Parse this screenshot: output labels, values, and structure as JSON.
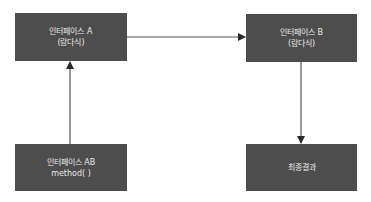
{
  "diagram": {
    "nodes": {
      "a": {
        "line1": "인터페이스 A",
        "line2": "(람다식)"
      },
      "b": {
        "line1": "인터페이스 B",
        "line2": "(람다식)"
      },
      "ab": {
        "line1": "인터페이스 AB",
        "line2": "method( )"
      },
      "final": {
        "line1": "최종결과"
      }
    },
    "edges": [
      {
        "from": "인터페이스 AB",
        "to": "인터페이스 A"
      },
      {
        "from": "인터페이스 A",
        "to": "인터페이스 B"
      },
      {
        "from": "인터페이스 B",
        "to": "최종결과"
      }
    ],
    "colors": {
      "box": "#4d4d4d",
      "text": "#e8e8e8",
      "line": "#333333"
    }
  }
}
